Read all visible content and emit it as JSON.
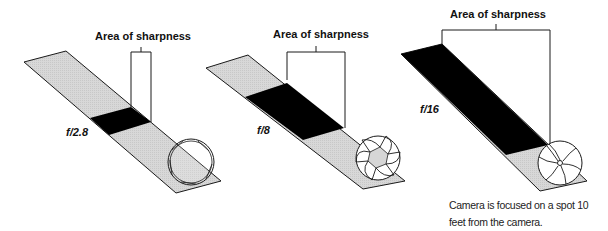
{
  "colors": {
    "strip_gray": "#d6d6d6",
    "sharp_black": "#000000",
    "line": "#1a1a1a",
    "background": "#ffffff"
  },
  "panels": [
    {
      "aperture": "f/2.8",
      "bracket_label": "Area of sharpness",
      "depth_of_field": "narrow"
    },
    {
      "aperture": "f/8",
      "bracket_label": "Area of sharpness",
      "depth_of_field": "medium"
    },
    {
      "aperture": "f/16",
      "bracket_label": "Area of sharpness",
      "depth_of_field": "deep"
    }
  ],
  "caption": {
    "line1": "Camera is focused on a spot 10",
    "line2": "feet from the camera."
  }
}
